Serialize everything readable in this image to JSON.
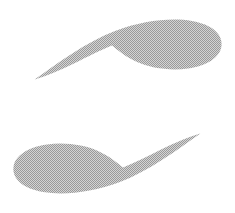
{
  "canvas": {
    "width": 235,
    "height": 213,
    "background_color": "#ffffff",
    "title": "Logo Mark"
  },
  "palette": {
    "shape_fill": "#a8a8a8",
    "dither_light": "#d4d4d4",
    "dither_dark": "#9a9a9a",
    "background": "#ffffff"
  },
  "graphic": {
    "name": "two-crescent-emblem",
    "description": "Two tapering crescent shapes in gray, arranged with 180-degree rotational symmetry forming an open circular motif",
    "symmetry": "rotational-180",
    "shape_count": 2,
    "texture": "halftone-dither"
  },
  "shapes": [
    {
      "id": "crescent-top",
      "label": "Upper Crescent",
      "orientation": "thick-right-taper-left",
      "tip_point": "34,79",
      "bulb_center": "185,44",
      "path": "M 34.5 79.5 C 58 63 86 42 115 31 C 143 20.5 171 17.5 192 21 C 213 24.5 223 35 221.5 46 C 220 57.5 207 66 188 68.5 C 170 71 150 68 137 62 C 126 57 118 50.5 112 45.5 C 101 50 88 56.5 74 63.5 C 60 70.5 45 76.5 34.5 79.5 Z"
    },
    {
      "id": "crescent-bottom",
      "label": "Lower Crescent",
      "orientation": "thick-left-taper-right",
      "tip_point": "200.5,133.5",
      "bulb_center": "50,169",
      "path": "M 200.5 133.5 C 177 150 149 171 120 182 C 92 192.5 64 195.5 43 192 C 22 188.5 12 178 13.5 167 C 15 155.5 28 147 47 144.5 C 65 142 85 145 98 151 C 109 156 117 162.5 123 167.5 C 134 163 147 156.5 161 149.5 C 175 142.5 190 136.5 200.5 133.5 Z"
    }
  ]
}
